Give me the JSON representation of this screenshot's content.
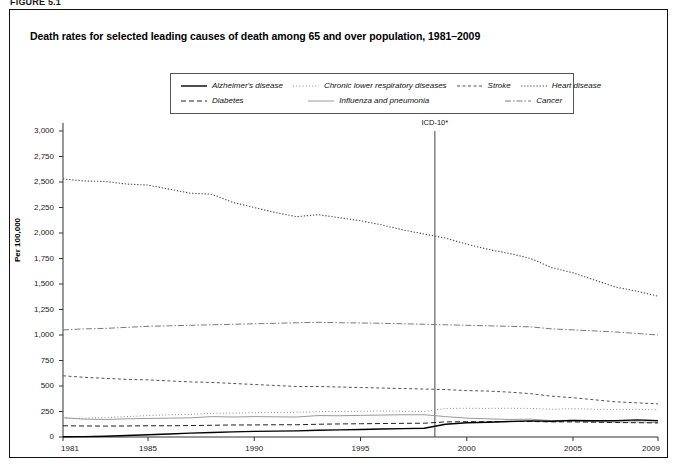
{
  "figure": {
    "label": "FIGURE 5.1",
    "title": "Death rates for selected leading causes of death among 65 and over population, 1981–2009"
  },
  "annotations": {
    "icd_marker": "ICD-10*",
    "icd_year": 1998.5
  },
  "axes": {
    "ylabel": "Per 100,000",
    "yticks": [
      "3,000",
      "2,750",
      "2,500",
      "2,250",
      "2,000",
      "1,750",
      "1,500",
      "1,250",
      "1,000",
      "750",
      "500",
      "250",
      "0"
    ],
    "ytick_values": [
      3000,
      2750,
      2500,
      2250,
      2000,
      1750,
      1500,
      1250,
      1000,
      750,
      500,
      250,
      0
    ],
    "xticks": [
      "1981",
      "1985",
      "1990",
      "1995",
      "2000",
      "2005",
      "2009"
    ],
    "xtick_values": [
      1981,
      1985,
      1990,
      1995,
      2000,
      2005,
      2009
    ]
  },
  "legend": {
    "rows": [
      [
        {
          "label": "Alzheimer's disease",
          "key": "alzheimers"
        },
        {
          "label": "Chronic lower respiratory diseases",
          "key": "clrd"
        },
        {
          "label": "Stroke",
          "key": "stroke"
        },
        {
          "label": "Heart disease",
          "key": "heart"
        }
      ],
      [
        {
          "label": "Diabetes",
          "key": "diabetes"
        },
        {
          "label": "Influenza and pneumonia",
          "key": "influenza"
        },
        {
          "label": "Cancer",
          "key": "cancer"
        }
      ]
    ]
  },
  "chart_data": {
    "type": "line",
    "title": "Death rates for selected leading causes of death among 65 and over population, 1981–2009",
    "xlabel": "",
    "ylabel": "Per 100,000",
    "xlim": [
      1981,
      2009
    ],
    "ylim": [
      0,
      3000
    ],
    "grid": false,
    "legend_position": "top",
    "x": [
      1981,
      1982,
      1983,
      1984,
      1985,
      1986,
      1987,
      1988,
      1989,
      1990,
      1991,
      1992,
      1993,
      1994,
      1995,
      1996,
      1997,
      1998,
      1999,
      2000,
      2001,
      2002,
      2003,
      2004,
      2005,
      2006,
      2007,
      2008,
      2009
    ],
    "series": [
      {
        "name": "Heart disease",
        "key": "heart",
        "style": "dotted",
        "color": "#4a4a4a",
        "width": 1.1,
        "values": [
          2530,
          2510,
          2505,
          2480,
          2470,
          2430,
          2390,
          2380,
          2300,
          2250,
          2200,
          2160,
          2180,
          2150,
          2120,
          2080,
          2030,
          1990,
          1950,
          1890,
          1840,
          1800,
          1750,
          1660,
          1610,
          1540,
          1470,
          1430,
          1380
        ]
      },
      {
        "name": "Cancer",
        "key": "cancer",
        "style": "dashdot",
        "color": "#7a7a7a",
        "width": 1.0,
        "values": [
          1050,
          1060,
          1065,
          1075,
          1085,
          1090,
          1095,
          1100,
          1105,
          1110,
          1115,
          1120,
          1125,
          1120,
          1118,
          1115,
          1110,
          1105,
          1100,
          1095,
          1090,
          1085,
          1080,
          1060,
          1050,
          1040,
          1030,
          1015,
          1000
        ]
      },
      {
        "name": "Stroke",
        "key": "stroke",
        "style": "dashed-fine",
        "color": "#555555",
        "width": 1.0,
        "values": [
          600,
          585,
          575,
          565,
          560,
          550,
          540,
          535,
          525,
          515,
          505,
          495,
          495,
          490,
          485,
          480,
          475,
          470,
          465,
          455,
          450,
          440,
          425,
          400,
          385,
          365,
          345,
          335,
          325
        ]
      },
      {
        "name": "Chronic lower respiratory diseases",
        "key": "clrd",
        "style": "dotted-fine",
        "color": "#8a8a8a",
        "width": 1.0,
        "values": [
          180,
          185,
          190,
          200,
          210,
          218,
          222,
          232,
          234,
          238,
          240,
          242,
          248,
          252,
          252,
          255,
          252,
          250,
          280,
          282,
          280,
          282,
          280,
          272,
          278,
          272,
          270,
          272,
          265
        ]
      },
      {
        "name": "Influenza and pneumonia",
        "key": "influenza",
        "style": "solid-light",
        "color": "#9a9a9a",
        "width": 1.0,
        "values": [
          190,
          175,
          172,
          178,
          182,
          185,
          188,
          200,
          196,
          200,
          198,
          196,
          210,
          208,
          212,
          215,
          218,
          218,
          200,
          185,
          178,
          172,
          175,
          160,
          165,
          150,
          145,
          148,
          140
        ]
      },
      {
        "name": "Diabetes",
        "key": "diabetes",
        "style": "dashed",
        "color": "#222222",
        "width": 1.0,
        "values": [
          110,
          108,
          107,
          108,
          110,
          110,
          112,
          115,
          118,
          118,
          120,
          120,
          125,
          128,
          130,
          132,
          134,
          135,
          148,
          150,
          150,
          152,
          152,
          148,
          148,
          145,
          142,
          140,
          138
        ]
      },
      {
        "name": "Alzheimer's disease",
        "key": "alzheimers",
        "style": "solid",
        "color": "#000000",
        "width": 1.4,
        "values": [
          2,
          4,
          8,
          14,
          22,
          30,
          38,
          44,
          50,
          55,
          58,
          60,
          66,
          70,
          74,
          78,
          82,
          86,
          125,
          140,
          145,
          152,
          158,
          155,
          162,
          160,
          160,
          168,
          160
        ]
      }
    ]
  }
}
